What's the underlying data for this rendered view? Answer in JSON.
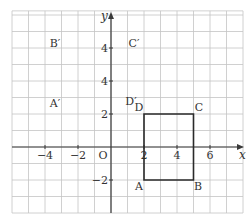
{
  "diagram": {
    "type": "coordinate-grid",
    "pixel_frame": {
      "origin_px": [
        111,
        147
      ],
      "unit_px": 16.5,
      "x_range": [
        -6,
        8
      ],
      "y_range": [
        -4,
        8.25
      ]
    },
    "axes": {
      "x_label": "x",
      "y_label": "y",
      "origin_label": "O",
      "x_ticks": [
        {
          "value": -4,
          "label": "−4"
        },
        {
          "value": -2,
          "label": "−2"
        },
        {
          "value": 2,
          "label": "2"
        },
        {
          "value": 4,
          "label": "4"
        },
        {
          "value": 6,
          "label": "6"
        }
      ],
      "y_ticks": [
        {
          "value": 6,
          "label": "4"
        },
        {
          "value": 4,
          "label": "4"
        },
        {
          "value": 2,
          "label": "2"
        },
        {
          "value": -2,
          "label": "−2"
        }
      ]
    },
    "shape": {
      "name": "rectangle ABCD",
      "vertices": {
        "A": [
          2,
          -2
        ],
        "B": [
          5,
          -2
        ],
        "C": [
          5,
          2
        ],
        "D": [
          2,
          2
        ]
      }
    },
    "point_labels": [
      {
        "id": "A",
        "text": "A",
        "px": [
          139,
          190
        ]
      },
      {
        "id": "B",
        "text": "B",
        "px": [
          198,
          190
        ]
      },
      {
        "id": "C",
        "text": "C",
        "px": [
          199,
          111
        ]
      },
      {
        "id": "D",
        "text": "D",
        "px": [
          139,
          111
        ]
      },
      {
        "id": "A-prime",
        "text": "A′",
        "px": [
          55,
          107
        ]
      },
      {
        "id": "B-prime",
        "text": "B′",
        "px": [
          55,
          47
        ]
      },
      {
        "id": "C-prime",
        "text": "C′",
        "px": [
          134,
          47
        ]
      },
      {
        "id": "D-prime",
        "text": "D′",
        "px": [
          131,
          105
        ]
      }
    ],
    "colors": {
      "grid": "#c4c4c4",
      "axes": "#3a3a3a",
      "shape": "#2a2a2a",
      "text": "#333333",
      "background": "#ffffff"
    }
  }
}
